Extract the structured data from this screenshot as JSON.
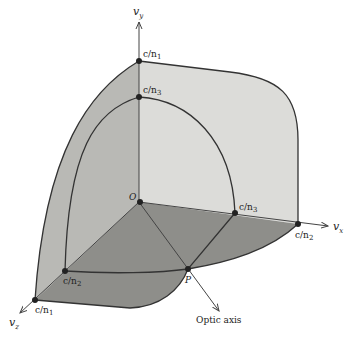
{
  "diagram": {
    "type": "wave-velocity-surface",
    "axes": {
      "vy": "v_y",
      "vx": "v_x",
      "vz": "v_z",
      "vy_main": "v",
      "vy_sub": "y",
      "vx_main": "v",
      "vx_sub": "x",
      "vz_main": "v",
      "vz_sub": "z"
    },
    "points": {
      "origin": "O",
      "p": "P",
      "top_outer": "c/n",
      "top_outer_sub": "1",
      "top_inner": "c/n",
      "top_inner_sub": "3",
      "right_inner": "c/n",
      "right_inner_sub": "3",
      "right_outer": "c/n",
      "right_outer_sub": "2",
      "front_inner": "c/n",
      "front_inner_sub": "2",
      "front_outer": "c/n",
      "front_outer_sub": "1"
    },
    "optic_axis_label": "Optic axis",
    "colors": {
      "light_face": "#d9d9d6",
      "mid_face": "#b8b8b4",
      "dark_face": "#8f8f8b",
      "line": "#333333"
    }
  }
}
